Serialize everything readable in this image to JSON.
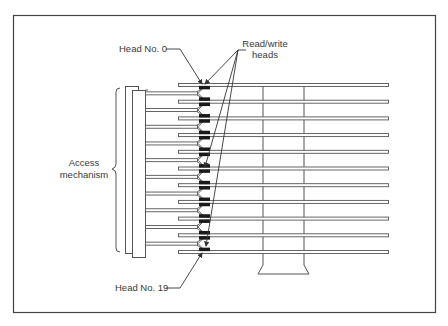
{
  "diagram": {
    "type": "disk-pack-access-mechanism",
    "labels": {
      "head_top": "Head No. 0",
      "head_bottom": "Head No. 19",
      "rw_line1": "Read/write",
      "rw_line2": "heads",
      "access_line1": "Access",
      "access_line2": "mechanism"
    },
    "platter_count": 11,
    "arm_count": 10,
    "colors": {
      "stroke": "#555555",
      "head_fill": "#1a1a1a",
      "background": "#ffffff"
    }
  }
}
